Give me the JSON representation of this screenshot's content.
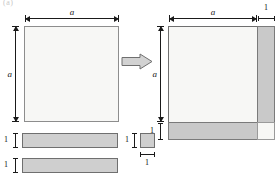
{
  "figure": {
    "caption": "(a)",
    "type": "geometric-proof-completing-the-square",
    "colors": {
      "square_fill": "#f7f7f5",
      "piece_fill": "#cfcfcf",
      "stroke": "#6f6f6f",
      "label": "#1a1a1a"
    }
  },
  "left_panel": {
    "square": {
      "name": "square-a",
      "width_label": "a",
      "height_label": "a"
    },
    "pieces": [
      {
        "name": "rect-1-by-a-top",
        "height_label": "1",
        "width_label": "a"
      },
      {
        "name": "rect-1-by-a-bottom",
        "height_label": "1",
        "width_label": "a"
      },
      {
        "name": "unit-square",
        "height_label": "1",
        "width_label": "1"
      }
    ]
  },
  "transform": {
    "arrow": "block-arrow-right",
    "meaning": "assembled into"
  },
  "right_panel": {
    "assembled_square": {
      "name": "square-a-plus-1",
      "top_dims": [
        "a",
        "1"
      ],
      "left_dims": [
        "a",
        "1"
      ]
    },
    "regions": [
      {
        "name": "region-a-squared",
        "label": "",
        "fill": "white"
      },
      {
        "name": "region-right-strip",
        "label": "",
        "fill": "gray"
      },
      {
        "name": "region-bottom-strip",
        "label": "",
        "fill": "gray"
      },
      {
        "name": "region-corner-unit",
        "label": "",
        "fill": "white"
      }
    ]
  }
}
